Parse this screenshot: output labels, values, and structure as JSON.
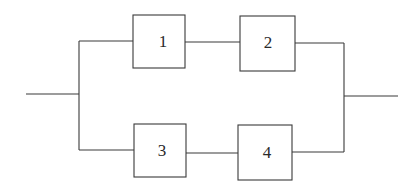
{
  "diagram": {
    "type": "reliability-block-diagram",
    "blocks": [
      {
        "id": "1",
        "label": "1",
        "path": "top"
      },
      {
        "id": "2",
        "label": "2",
        "path": "top"
      },
      {
        "id": "3",
        "label": "3",
        "path": "bottom"
      },
      {
        "id": "4",
        "label": "4",
        "path": "bottom"
      }
    ],
    "connections": [
      {
        "from": "input",
        "to": "split"
      },
      {
        "from": "split",
        "to": "1"
      },
      {
        "from": "1",
        "to": "2"
      },
      {
        "from": "2",
        "to": "join"
      },
      {
        "from": "split",
        "to": "3"
      },
      {
        "from": "3",
        "to": "4"
      },
      {
        "from": "4",
        "to": "join"
      },
      {
        "from": "join",
        "to": "output"
      }
    ],
    "line_color": "#3a3a3a"
  }
}
